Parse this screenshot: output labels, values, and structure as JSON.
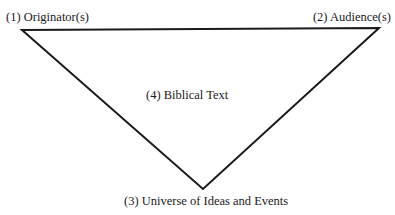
{
  "diagram": {
    "type": "inverted-triangle",
    "stroke_color": "#1a1a1a",
    "background": "#ffffff",
    "vertices": {
      "originator": {
        "x": 22,
        "y": 30
      },
      "audience": {
        "x": 379,
        "y": 28
      },
      "universe": {
        "x": 203,
        "y": 189
      }
    },
    "labels": {
      "originator": "(1) Originator(s)",
      "audience": "(2) Audience(s)",
      "universe": "(3) Universe of Ideas and Events",
      "biblical_text": "(4) Biblical Text"
    }
  }
}
